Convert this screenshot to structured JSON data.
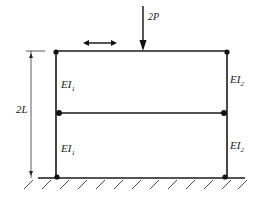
{
  "diagram": {
    "type": "two-story frame structure",
    "load": {
      "label": "2P",
      "direction": "down"
    },
    "sway_indicator": {
      "type": "double-headed horizontal arrow"
    },
    "dimension": {
      "label": "2L",
      "span": "ground to top beam"
    },
    "members": {
      "left_upper": {
        "label_base": "EI",
        "label_sub": "1"
      },
      "left_lower": {
        "label_base": "EI",
        "label_sub": "1"
      },
      "right_upper": {
        "label_base": "EI",
        "label_sub": "2"
      },
      "right_lower": {
        "label_base": "EI",
        "label_sub": "2"
      }
    },
    "support": {
      "type": "fixed ground (hatched)"
    },
    "colors": {
      "line": "#1a1a1a",
      "background": "#ffffff"
    }
  }
}
